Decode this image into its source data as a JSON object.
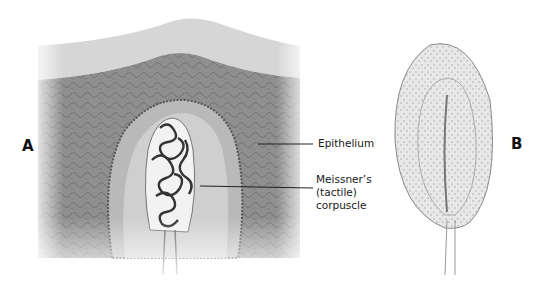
{
  "figure": {
    "panels": [
      {
        "letter": "A",
        "description": "Cross-section of skin with dermal papilla containing tactile corpuscle"
      },
      {
        "letter": "B",
        "description": "Isolated Meissner's corpuscle"
      }
    ],
    "labels": {
      "epithelium": "Epithelium",
      "corpuscle_line1": "Meissner’s",
      "corpuscle_line2": "(tactile)",
      "corpuscle_line3": "corpuscle"
    },
    "colors": {
      "background": "#ffffff",
      "stratum_corneum": "#d4d4d4",
      "epidermis": "#8e8e8e",
      "papilla": "#c9c9c9",
      "corpuscle_core": "#f1f1f1",
      "nerve_coils": "#3a3a3a",
      "leader_line": "#222222"
    }
  }
}
